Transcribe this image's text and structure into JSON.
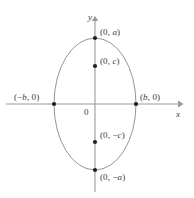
{
  "figure": {
    "kind": "ellipse-diagram",
    "width": 194,
    "height": 198,
    "background_color": "#ffffff",
    "stroke_color": "#8a8a8a",
    "axis_color": "#9a9a9a",
    "text_color": "#3a3a3a",
    "point_color": "#1a1a1a"
  },
  "axes": {
    "x_label": "x",
    "y_label": "y",
    "origin_label": "0",
    "origin_px": {
      "x": 95,
      "y": 104
    },
    "x_axis_px": {
      "x1": 6,
      "y1": 104,
      "x2": 181,
      "y2": 104
    },
    "y_axis_px": {
      "x1": 95,
      "y1": 18,
      "x2": 95,
      "y2": 192
    },
    "x_arrow": "arrow-right",
    "y_arrow": "arrow-up"
  },
  "ellipse": {
    "center_px": {
      "x": 95,
      "y": 104
    },
    "semi_minor_x_px": 41,
    "semi_major_y_px": 66,
    "stroke_width": 0.9
  },
  "points": [
    {
      "id": "top-vertex",
      "label": "(0, a)",
      "label_text": "(0, ",
      "label_var": "a",
      "label_tail": ")",
      "px": {
        "x": 95,
        "y": 38
      },
      "on_curve": true
    },
    {
      "id": "upper-focus",
      "label": "(0, c)",
      "label_text": "(0, ",
      "label_var": "c",
      "label_tail": ")",
      "px": {
        "x": 95,
        "y": 66
      },
      "on_curve": false
    },
    {
      "id": "left-vertex",
      "label": "(-b, 0)",
      "label_text": "(−",
      "label_var": "b",
      "label_tail": ", 0)",
      "px": {
        "x": 54,
        "y": 104
      },
      "on_curve": true
    },
    {
      "id": "right-vertex",
      "label": "(b, 0)",
      "label_text": "(",
      "label_var": "b",
      "label_tail": ", 0)",
      "px": {
        "x": 136,
        "y": 104
      },
      "on_curve": true
    },
    {
      "id": "lower-focus",
      "label": "(0, -c)",
      "label_text": "(0, −",
      "label_var": "c",
      "label_tail": ")",
      "px": {
        "x": 95,
        "y": 142
      },
      "on_curve": false
    },
    {
      "id": "bottom-vertex",
      "label": "(0, -a)",
      "label_text": "(0, −",
      "label_var": "a",
      "label_tail": ")",
      "px": {
        "x": 95,
        "y": 170
      },
      "on_curve": true
    }
  ],
  "labels": {
    "top_vertex_prefix": "(0, ",
    "top_vertex_var": "a",
    "top_vertex_suffix": ")",
    "upper_focus_prefix": "(0, ",
    "upper_focus_var": "c",
    "upper_focus_suffix": ")",
    "left_vertex_prefix": "(−",
    "left_vertex_var": "b",
    "left_vertex_suffix": ", 0)",
    "right_vertex_prefix": "(",
    "right_vertex_var": "b",
    "right_vertex_suffix": ", 0)",
    "lower_focus_prefix": "(0, −",
    "lower_focus_var": "c",
    "lower_focus_suffix": ")",
    "bottom_vertex_prefix": "(0, −",
    "bottom_vertex_var": "a",
    "bottom_vertex_suffix": ")"
  }
}
